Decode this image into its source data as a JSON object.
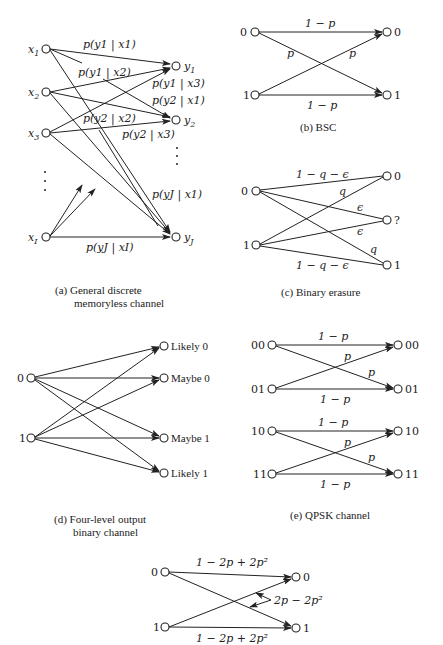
{
  "panels": {
    "a": {
      "caption_line1": "(a)  General discrete",
      "caption_line2": "memoryless channel",
      "inputs": [
        "x1",
        "x2",
        "x3",
        "xI"
      ],
      "outputs": [
        "y1",
        "y2",
        "yJ"
      ],
      "edge_labels": {
        "y1x1": "p(y1 | x1)",
        "y1x2": "p(y1 | x2)",
        "y1x3": "p(y1 | x3)",
        "y2x1": "p(y2 | x1)",
        "y2x2": "p(y2 | x2)",
        "y2x3": "p(y2 | x3)",
        "yJx1": "p(yJ | x1)",
        "yJxI": "p(yJ | xI)"
      }
    },
    "b": {
      "caption": "(b)  BSC",
      "inputs": [
        "0",
        "1"
      ],
      "outputs": [
        "0",
        "1"
      ],
      "labels": {
        "top": "1 − p",
        "cross_down": "p",
        "cross_up": "p",
        "bottom": "1 − p"
      }
    },
    "c": {
      "caption": "(c)  Binary erasure",
      "inputs": [
        "0",
        "1"
      ],
      "outputs": [
        "0",
        "?",
        "1"
      ],
      "labels": {
        "top": "1 − q − ϵ",
        "q_up": "q",
        "eps_top": "ϵ",
        "eps_bottom": "ϵ",
        "q_down": "q",
        "bottom": "1 − q − ϵ"
      }
    },
    "d": {
      "caption_line1": "(d)  Four-level output",
      "caption_line2": "binary channel",
      "inputs": [
        "0",
        "1"
      ],
      "outputs": [
        "Likely 0",
        "Maybe 0",
        "Maybe 1",
        "Likely 1"
      ]
    },
    "e": {
      "caption": "(e)  QPSK channel",
      "inputs": [
        "00",
        "01",
        "10",
        "11"
      ],
      "outputs": [
        "00",
        "01",
        "10",
        "11"
      ],
      "labels": {
        "straight": "1 − p",
        "cross": "p"
      }
    },
    "f": {
      "inputs": [
        "0",
        "1"
      ],
      "outputs": [
        "0",
        "1"
      ],
      "labels": {
        "top": "1 − 2p + 2p²",
        "cross": "2p − 2p²",
        "bottom": "1 − 2p + 2p²"
      }
    }
  }
}
